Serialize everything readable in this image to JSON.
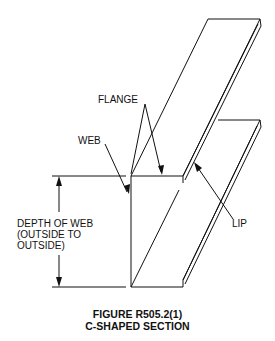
{
  "figure": {
    "labels": {
      "flange": "FLANGE",
      "web": "WEB",
      "lip": "LIP",
      "depth_line1": "DEPTH OF WEB",
      "depth_line2": "(OUTSIDE TO",
      "depth_line3": "OUTSIDE)"
    },
    "caption": {
      "line1": "FIGURE R505.2(1)",
      "line2": "C-SHAPED SECTION"
    },
    "colors": {
      "stroke": "#111111",
      "background": "#ffffff"
    }
  }
}
